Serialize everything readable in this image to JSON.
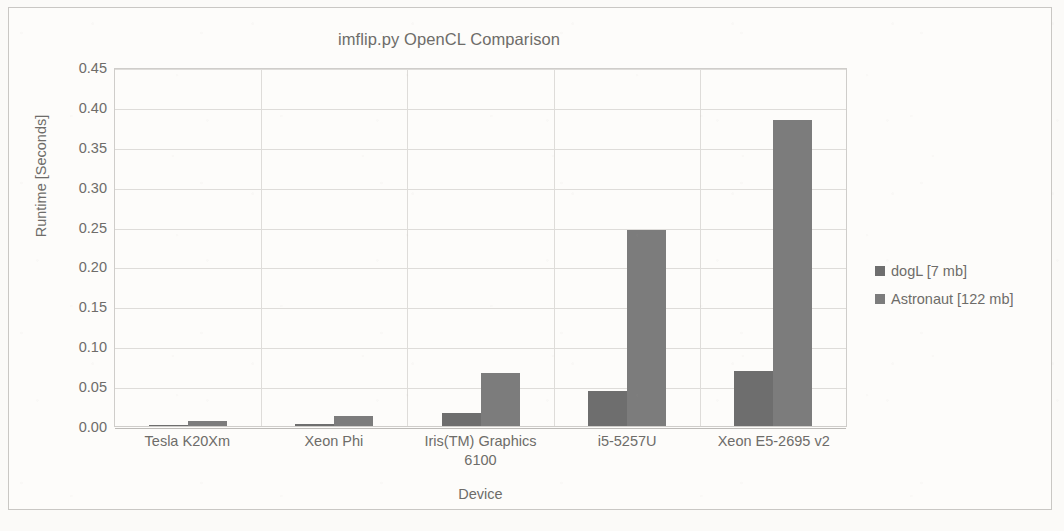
{
  "chart_data": {
    "type": "bar",
    "title": "imflip.py OpenCL Comparison",
    "xlabel": "Device",
    "ylabel": "Runtime [Seconds]",
    "ylim": [
      0,
      0.45
    ],
    "yticks": [
      "0.00",
      "0.05",
      "0.10",
      "0.15",
      "0.20",
      "0.25",
      "0.30",
      "0.35",
      "0.40",
      "0.45"
    ],
    "ytick_values": [
      0.0,
      0.05,
      0.1,
      0.15,
      0.2,
      0.25,
      0.3,
      0.35,
      0.4,
      0.45
    ],
    "grid": true,
    "legend_position": "right",
    "categories": [
      "Tesla K20Xm",
      "Xeon Phi",
      "Iris(TM) Graphics 6100",
      "i5-5257U",
      "Xeon E5-2695 v2"
    ],
    "series": [
      {
        "name": "dogL [7 mb]",
        "color": "#6e6e6e",
        "values": [
          0.001,
          0.003,
          0.016,
          0.044,
          0.069
        ]
      },
      {
        "name": "Astronaut [122 mb]",
        "color": "#7c7c7c",
        "values": [
          0.006,
          0.012,
          0.066,
          0.246,
          0.383
        ]
      }
    ]
  },
  "colors": {
    "series_dogl": "#6e6e6e",
    "series_astronaut": "#7c7c7c",
    "text": "#6e6c69",
    "gridline": "#dedcd9",
    "frame_border": "#c9c7c4",
    "page_background": "#fbfaf8"
  }
}
